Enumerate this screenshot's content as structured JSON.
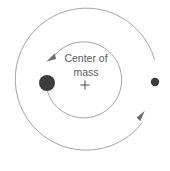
{
  "figure": {
    "title_line_1": "Center of",
    "title_line_2": "mass",
    "center_marker_glyph": "+",
    "background_color": "#ffffff",
    "orbit_stroke_color": "#9a9a9a",
    "arrow_color": "#6f6f6f",
    "label_color": "#5b5b5b",
    "large_body_color": "#3c3c3c",
    "small_body_color": "#3c3c3c",
    "labels": {
      "large_body": "primary-star",
      "small_body": "companion-star",
      "inner_orbit": "inner-orbit",
      "outer_orbit": "outer-orbit",
      "center_of_mass": "center-of-mass-marker"
    },
    "geometry": {
      "center_x": 85,
      "center_y": 83,
      "inner_orbit_radius": 38,
      "outer_orbit_radius": 71,
      "large_body_x": 47,
      "large_body_y": 83,
      "large_body_radius": 8,
      "small_body_x": 155,
      "small_body_y": 82,
      "small_body_radius": 4.2,
      "inner_arrow_x": 51,
      "inner_arrow_y": 58,
      "outer_arrow_x": 142,
      "outer_arrow_y": 122,
      "label_line_1_y": 62,
      "label_line_2_y": 76,
      "cross_y": 85,
      "cross_half": 4.5,
      "orbit_direction": "counterclockwise"
    }
  }
}
